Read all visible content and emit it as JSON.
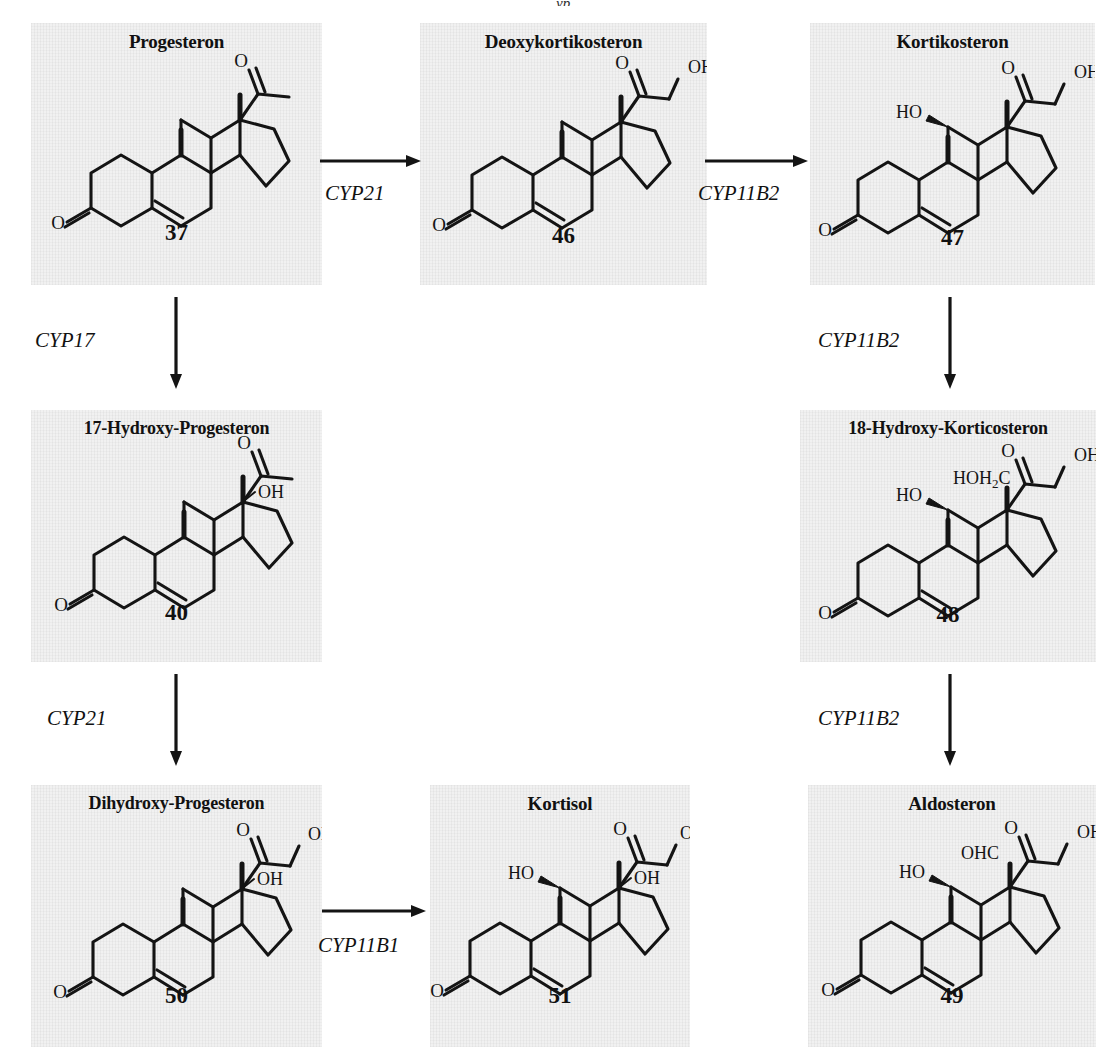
{
  "diagram": {
    "type": "reaction-pathway",
    "top_clipped_fragment": "yp"
  },
  "panels": [
    {
      "id": "progesteron",
      "title": "Progesteron",
      "number": "37",
      "row": 0,
      "col": 0
    },
    {
      "id": "deoxykortikosteron",
      "title": "Deoxykortikosteron",
      "number": "46",
      "row": 0,
      "col": 1
    },
    {
      "id": "kortikosteron",
      "title": "Kortikosteron",
      "number": "47",
      "row": 0,
      "col": 2
    },
    {
      "id": "17-hydroxy-progesteron",
      "title": "17-Hydroxy-Progesteron",
      "number": "40",
      "row": 1,
      "col": 0
    },
    {
      "id": "18-hydroxy-korticosteron",
      "title": "18-Hydroxy-Korticosteron",
      "number": "48",
      "row": 1,
      "col": 2
    },
    {
      "id": "dihydroxy-progesteron",
      "title": "Dihydroxy-Progesteron",
      "number": "50",
      "row": 2,
      "col": 0
    },
    {
      "id": "kortisol",
      "title": "Kortisol",
      "number": "51",
      "row": 2,
      "col": 1
    },
    {
      "id": "aldosteron",
      "title": "Aldosteron",
      "number": "49",
      "row": 2,
      "col": 2
    }
  ],
  "substituent_labels": {
    "oh": "OH",
    "ho": "HO",
    "o": "O",
    "hoh2c_prefix": "HOH",
    "hoh2c_sub": "2",
    "hoh2c_suffix": "C",
    "ohc": "OHC"
  },
  "arrows": [
    {
      "id": "progesteron-to-deoxykortikosteron",
      "label": "CYP21",
      "direction": "right"
    },
    {
      "id": "deoxykortikosteron-to-kortikosteron",
      "label": "CYP11B2",
      "direction": "right"
    },
    {
      "id": "progesteron-to-17-hydroxy-progesteron",
      "label": "CYP17",
      "direction": "down"
    },
    {
      "id": "kortikosteron-to-18-hydroxy-korticosteron",
      "label": "CYP11B2",
      "direction": "down"
    },
    {
      "id": "17-hydroxy-progesteron-to-dihydroxy-progesteron",
      "label": "CYP21",
      "direction": "down"
    },
    {
      "id": "18-hydroxy-korticosteron-to-aldosteron",
      "label": "CYP11B2",
      "direction": "down"
    },
    {
      "id": "dihydroxy-progesteron-to-kortisol",
      "label": "CYP11B1",
      "direction": "right"
    }
  ],
  "colors": {
    "panel_background": "#f1f1f1",
    "page_background": "#ffffff",
    "ink": "#111111"
  }
}
